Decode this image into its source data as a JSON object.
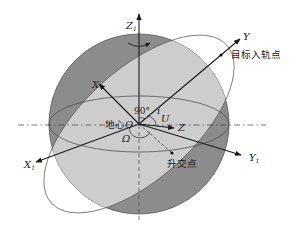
{
  "diagram": {
    "type": "orbital-coordinate-frame",
    "colors": {
      "sphere_dark": "#8a8a8a",
      "orbit_plane": "#c9c9c9",
      "sphere_outline": "#555555",
      "axis": "#1a1a1a",
      "background": "#ffffff"
    },
    "axes": {
      "z1": {
        "label": "Z",
        "sub": "1"
      },
      "x1": {
        "label": "X",
        "sub": "1"
      },
      "y1": {
        "label": "Y",
        "sub": "1"
      },
      "x": {
        "label": "X"
      },
      "y": {
        "label": "Y"
      },
      "z": {
        "label": "Z"
      }
    },
    "labels": {
      "target_entry_point": "目标入轨点",
      "earth_center": "地心",
      "origin": "O",
      "ascending_node": "升交点",
      "angle_90": "90°",
      "inclination": "i",
      "arg_latitude": "U",
      "raan": "Ω"
    }
  }
}
